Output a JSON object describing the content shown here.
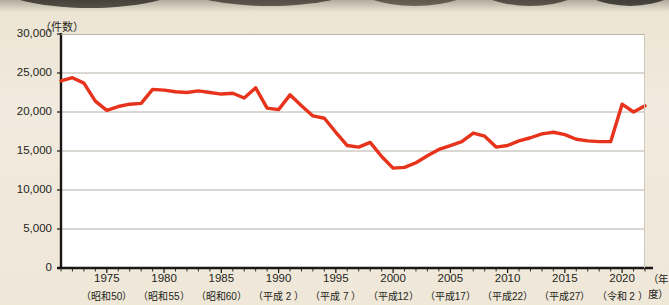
{
  "figure": {
    "background_color": "#efe7d7",
    "plot_background_color": "#ffffff",
    "line_color": "#e8331c",
    "grid_color": "#b5b0a6",
    "axis_color": "#1a1614"
  },
  "axes": {
    "y_unit_label": "（件数）",
    "x_unit_label": "（年度）",
    "y_ticks": [
      "30,000",
      "25,000",
      "20,000",
      "15,000",
      "10,000",
      "5,000",
      "0"
    ],
    "x_ticks": [
      {
        "year": "1975",
        "era": "（昭和50）"
      },
      {
        "year": "1980",
        "era": "（昭和55）"
      },
      {
        "year": "1985",
        "era": "（昭和60）"
      },
      {
        "year": "1990",
        "era": "（平成 2 ）"
      },
      {
        "year": "1995",
        "era": "（平成 7 ）"
      },
      {
        "year": "2000",
        "era": "（平成12）"
      },
      {
        "year": "2005",
        "era": "（平成17）"
      },
      {
        "year": "2010",
        "era": "（平成22）"
      },
      {
        "year": "2015",
        "era": "（平成27）"
      },
      {
        "year": "2020",
        "era": "（令和 2 ）"
      }
    ]
  },
  "chart_data": {
    "type": "line",
    "title": "",
    "subtitle": "",
    "xlabel": "（年度）",
    "ylabel": "（件数）",
    "ylim": [
      0,
      30000
    ],
    "xlim": [
      1971,
      2022
    ],
    "ytick_step": 5000,
    "grid": "horizontal",
    "legend": "none",
    "series": [
      {
        "name": "件数",
        "color": "#e8331c",
        "x": [
          1971,
          1972,
          1973,
          1974,
          1975,
          1976,
          1977,
          1978,
          1979,
          1980,
          1981,
          1982,
          1983,
          1984,
          1985,
          1986,
          1987,
          1988,
          1989,
          1990,
          1991,
          1992,
          1993,
          1994,
          1995,
          1996,
          1997,
          1998,
          1999,
          2000,
          2001,
          2002,
          2003,
          2004,
          2005,
          2006,
          2007,
          2008,
          2009,
          2010,
          2011,
          2012,
          2013,
          2014,
          2015,
          2016,
          2017,
          2018,
          2019,
          2020,
          2021,
          2022
        ],
        "values": [
          24000,
          24400,
          23700,
          21400,
          20200,
          20700,
          21000,
          21100,
          22900,
          22800,
          22600,
          22500,
          22700,
          22500,
          22300,
          22400,
          21800,
          23100,
          20500,
          20300,
          22200,
          20800,
          19500,
          19200,
          17400,
          15700,
          15500,
          16100,
          14300,
          12800,
          12900,
          13500,
          14400,
          15200,
          15700,
          16200,
          17300,
          16900,
          15500,
          15700,
          16300,
          16700,
          17200,
          17400,
          17100,
          16500,
          16300,
          16200,
          16200,
          21000,
          20000,
          20800
        ]
      }
    ]
  }
}
